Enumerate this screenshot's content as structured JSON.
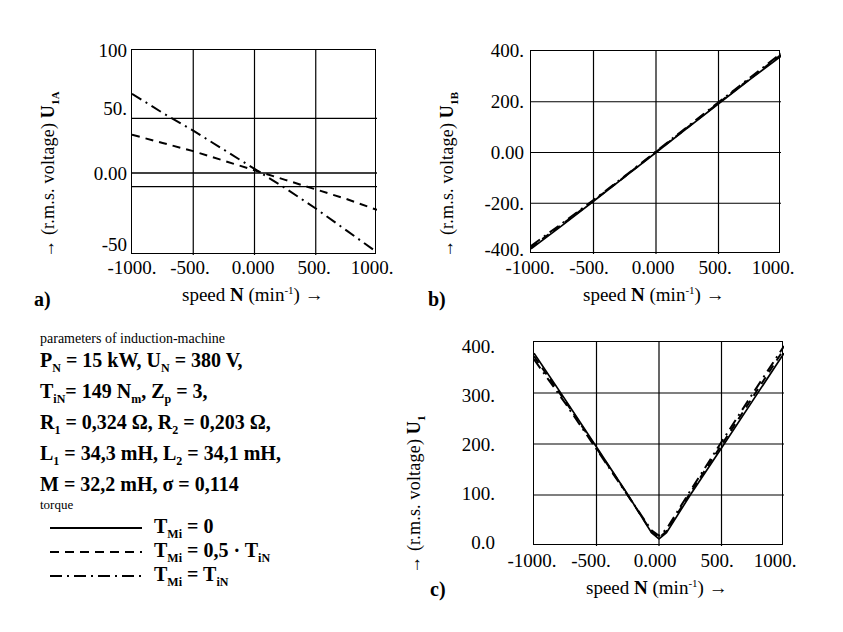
{
  "figure": {
    "panels": [
      {
        "id": "a)",
        "ylabel_prefix": "U",
        "ylabel_sub": "1A",
        "ylabel_rest": "(r.m.s. voltage)",
        "ylabel_arrow": "→",
        "xlabel_lead": "speed ",
        "xlabel_sym": "N",
        "xlabel_unit": " (min",
        "xlabel_exp": "-1",
        "xlabel_tail": ") →",
        "yticks": [
          "100",
          "50.",
          "0.00",
          "-50"
        ],
        "xticks": [
          "-1000.",
          "-500.",
          "0.000",
          "500.",
          "1000."
        ]
      },
      {
        "id": "b)",
        "ylabel_prefix": "U",
        "ylabel_sub": "1B",
        "ylabel_rest": "(r.m.s. voltage)",
        "ylabel_arrow": "→",
        "xlabel_lead": "speed ",
        "xlabel_sym": "N",
        "xlabel_unit": " (min",
        "xlabel_exp": "-1",
        "xlabel_tail": ") →",
        "yticks": [
          "400.",
          "200.",
          "0.00",
          "-200.",
          "-400."
        ],
        "xticks": [
          "-1000.",
          "-500.",
          "0.000",
          "500.",
          "1000."
        ]
      },
      {
        "id": "c)",
        "ylabel_prefix": "U",
        "ylabel_sub": "1",
        "ylabel_rest": "(r.m.s. voltage)",
        "ylabel_arrow": "→",
        "xlabel_lead": "speed ",
        "xlabel_sym": "N",
        "xlabel_unit": " (min",
        "xlabel_exp": "-1",
        "xlabel_tail": ") →",
        "yticks": [
          "400.",
          "300.",
          "200.",
          "100.",
          "0.0"
        ],
        "xticks": [
          "-1000.",
          "-500.",
          "0.000",
          "500.",
          "1000."
        ]
      }
    ]
  },
  "parameters": {
    "title": "parameters of induction-machine",
    "lines": [
      {
        "segments": [
          {
            "t": "P"
          },
          {
            "sub": "N"
          },
          {
            "t": " = 15 kW, U"
          },
          {
            "sub": "N"
          },
          {
            "t": " = 380 V,"
          }
        ]
      },
      {
        "segments": [
          {
            "t": "T"
          },
          {
            "sub": "iN"
          },
          {
            "t": "= 149 N"
          },
          {
            "sub": "m"
          },
          {
            "t": ", Z"
          },
          {
            "sub": "p"
          },
          {
            "t": " = 3,"
          }
        ]
      },
      {
        "segments": [
          {
            "t": "R"
          },
          {
            "sub": "1"
          },
          {
            "t": " = 0,324 Ω, R"
          },
          {
            "sub": "2"
          },
          {
            "t": " = 0,203 Ω,"
          }
        ]
      },
      {
        "segments": [
          {
            "t": "L"
          },
          {
            "sub": "1"
          },
          {
            "t": " = 34,3 mH, L"
          },
          {
            "sub": "2"
          },
          {
            "t": " = 34,1 mH,"
          }
        ]
      },
      {
        "segments": [
          {
            "t": "M  = 32,2 mH, σ = 0,114"
          }
        ]
      }
    ]
  },
  "legend": {
    "title": "torque",
    "entries": [
      {
        "style": "solid",
        "segments": [
          {
            "t": "T"
          },
          {
            "sub": "Mi"
          },
          {
            "t": " = 0"
          }
        ]
      },
      {
        "style": "dashed",
        "segments": [
          {
            "t": "T"
          },
          {
            "sub": "Mi"
          },
          {
            "t": " = 0,5 · T"
          },
          {
            "sub": "iN"
          }
        ]
      },
      {
        "style": "dashdot",
        "segments": [
          {
            "t": "T"
          },
          {
            "sub": "Mi"
          },
          {
            "t": " = T"
          },
          {
            "sub": "iN"
          }
        ]
      }
    ]
  },
  "chart_data": [
    {
      "type": "line",
      "panel": "a",
      "title": "",
      "xlabel": "speed N (min^-1)",
      "ylabel": "U_1A (r.m.s. voltage)",
      "xlim": [
        -1000,
        1000
      ],
      "ylim": [
        -50,
        100
      ],
      "grid": true,
      "xticks": [
        -1000,
        -500,
        0,
        500,
        1000
      ],
      "yticks": [
        -50,
        0,
        50,
        100
      ],
      "x": [
        -1000,
        -750,
        -500,
        -250,
        0,
        250,
        500,
        750,
        1000
      ],
      "series": [
        {
          "name": "T_Mi = 0",
          "style": "solid",
          "values": [
            10,
            10,
            10,
            10,
            10,
            10,
            10,
            10,
            10
          ]
        },
        {
          "name": "T_Mi = 0,5 * T_iN",
          "style": "dashed",
          "values": [
            38,
            32,
            26,
            19,
            12,
            5,
            -2,
            -9,
            -17
          ]
        },
        {
          "name": "T_Mi = T_iN",
          "style": "dashdot",
          "values": [
            68,
            54,
            41,
            27,
            13,
            -1,
            -16,
            -32,
            -48
          ]
        }
      ]
    },
    {
      "type": "line",
      "panel": "b",
      "title": "",
      "xlabel": "speed N (min^-1)",
      "ylabel": "U_1B (r.m.s. voltage)",
      "xlim": [
        -1000,
        1000
      ],
      "ylim": [
        -400,
        400
      ],
      "grid": true,
      "xticks": [
        -1000,
        -500,
        0,
        500,
        1000
      ],
      "yticks": [
        -400,
        -200,
        0,
        200,
        400
      ],
      "x": [
        -1000,
        -750,
        -500,
        -250,
        0,
        250,
        500,
        750,
        1000
      ],
      "series": [
        {
          "name": "T_Mi = 0",
          "style": "solid",
          "values": [
            -380,
            -287,
            -192,
            -96,
            0,
            96,
            192,
            287,
            380
          ]
        },
        {
          "name": "T_Mi = 0,5 * T_iN",
          "style": "dashed",
          "values": [
            -374,
            -283,
            -190,
            -95,
            2,
            98,
            195,
            290,
            385
          ]
        },
        {
          "name": "T_Mi = T_iN",
          "style": "dashdot",
          "values": [
            -368,
            -279,
            -187,
            -93,
            4,
            101,
            198,
            294,
            390
          ]
        }
      ]
    },
    {
      "type": "line",
      "panel": "c",
      "title": "",
      "xlabel": "speed N (min^-1)",
      "ylabel": "U_1 (r.m.s. voltage)",
      "xlim": [
        -1000,
        1000
      ],
      "ylim": [
        0,
        400
      ],
      "grid": true,
      "xticks": [
        -1000,
        -500,
        0,
        500,
        1000
      ],
      "yticks": [
        0,
        100,
        200,
        300,
        400
      ],
      "x": [
        -1000,
        -750,
        -500,
        -250,
        -60,
        0,
        60,
        250,
        500,
        750,
        1000
      ],
      "series": [
        {
          "name": "T_Mi = 0",
          "style": "solid",
          "values": [
            378,
            287,
            194,
            101,
            26,
            14,
            26,
            100,
            192,
            285,
            378
          ]
        },
        {
          "name": "T_Mi = 0,5 * T_iN",
          "style": "dashed",
          "values": [
            372,
            284,
            192,
            100,
            28,
            16,
            29,
            104,
            198,
            292,
            386
          ]
        },
        {
          "name": "T_Mi = T_iN",
          "style": "dashdot",
          "values": [
            366,
            280,
            190,
            99,
            31,
            20,
            33,
            108,
            204,
            299,
            392
          ]
        }
      ]
    }
  ]
}
